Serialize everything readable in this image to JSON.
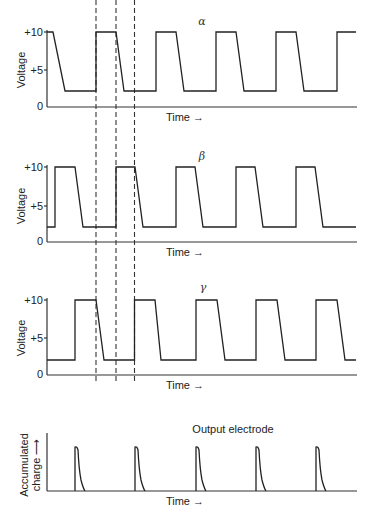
{
  "figure": {
    "panels": [
      {
        "id": "alpha",
        "label": "α",
        "ylabel": "Voltage",
        "xlabel": "Time →",
        "ticks": [
          "+10",
          "+5",
          "0"
        ]
      },
      {
        "id": "beta",
        "label": "β",
        "ylabel": "Voltage",
        "xlabel": "Time →",
        "ticks": [
          "+10",
          "+5",
          "0"
        ]
      },
      {
        "id": "gamma",
        "label": "γ",
        "ylabel": "Voltage",
        "xlabel": "Time →",
        "ticks": [
          "+10",
          "+5",
          "0"
        ]
      }
    ],
    "output": {
      "title": "Output electrode",
      "ylabel_line1": "Accumulated",
      "ylabel_line2": "charge ⟶",
      "xlabel": "Time →"
    },
    "line_color": "#222222",
    "background": "#ffffff"
  }
}
